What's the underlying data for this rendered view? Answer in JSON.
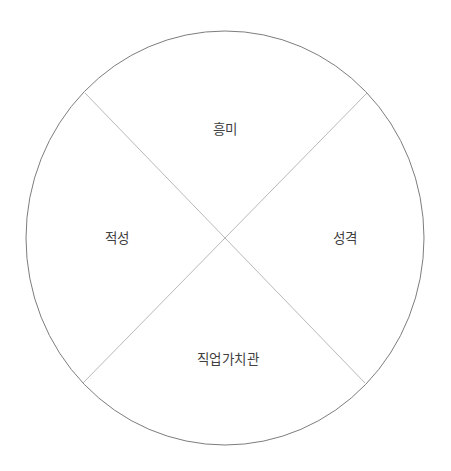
{
  "diagram": {
    "type": "quadrant-circle",
    "title": "",
    "background_color": "#ffffff",
    "circle": {
      "name": "outer-circle",
      "center_x": 225,
      "center_y": 238,
      "radius_x": 199,
      "radius_y": 207,
      "stroke_color": "#7d7d7d",
      "stroke_width": 1,
      "fill": "none"
    },
    "divider_lines": [
      {
        "name": "diagonal-nw-se",
        "x1": 85,
        "y1": 93,
        "x2": 365,
        "y2": 383,
        "stroke_color": "#b9b9b9",
        "stroke_width": 1
      },
      {
        "name": "diagonal-ne-sw",
        "x1": 367,
        "y1": 93,
        "x2": 83,
        "y2": 383,
        "stroke_color": "#b9b9b9",
        "stroke_width": 1
      }
    ],
    "text_color": "#3f3f3f",
    "quadrants": [
      {
        "id": "top",
        "label": "흥미",
        "position": "top"
      },
      {
        "id": "right",
        "label": "성격",
        "position": "right"
      },
      {
        "id": "bottom",
        "label": "직업가치관",
        "position": "bottom"
      },
      {
        "id": "left",
        "label": "적성",
        "position": "left"
      }
    ]
  }
}
